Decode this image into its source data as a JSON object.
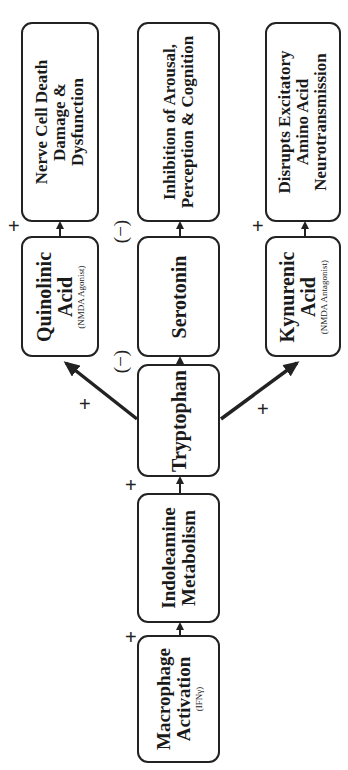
{
  "diagram": {
    "orientation": "rotated -90deg (flow reads bottom to top)",
    "nodes": {
      "macrophage": {
        "lines": [
          "Macrophage",
          "Activation"
        ],
        "sub": "(IFNγ)"
      },
      "indoleamine": {
        "lines": [
          "Indoleamine",
          "Metabolism"
        ]
      },
      "tryptophan": {
        "lines": [
          "Tryptophan"
        ]
      },
      "quinolinic": {
        "lines": [
          "Quinolinic",
          "Acid"
        ],
        "sub": "(NMDA Agonist)"
      },
      "serotonin": {
        "lines": [
          "Serotonin"
        ]
      },
      "kynurenic": {
        "lines": [
          "Kynurenic",
          "Acid"
        ],
        "sub": "(NMDA Antagonist)"
      },
      "nerve_cell": {
        "lines": [
          "Nerve Cell Death",
          "Damage &",
          "Dysfunction"
        ]
      },
      "inhibition": {
        "lines": [
          "Inhibition of Arousal,",
          "Perception & Cognition"
        ]
      },
      "disrupts": {
        "lines": [
          "Disrupts Excitatory",
          "Amino Acid",
          "Neurotransmission"
        ]
      }
    },
    "edges": [
      {
        "from": "macrophage",
        "to": "indoleamine",
        "sign": "+"
      },
      {
        "from": "indoleamine",
        "to": "tryptophan",
        "sign": "+"
      },
      {
        "from": "tryptophan",
        "to": "quinolinic",
        "sign": "+"
      },
      {
        "from": "tryptophan",
        "to": "serotonin",
        "sign": "(−)"
      },
      {
        "from": "tryptophan",
        "to": "kynurenic",
        "sign": "+"
      },
      {
        "from": "quinolinic",
        "to": "nerve_cell",
        "sign": "+"
      },
      {
        "from": "serotonin",
        "to": "inhibition",
        "sign": "(−)"
      },
      {
        "from": "kynurenic",
        "to": "disrupts",
        "sign": "+"
      }
    ],
    "signs": {
      "plus": "+",
      "minus": "(−)"
    }
  }
}
